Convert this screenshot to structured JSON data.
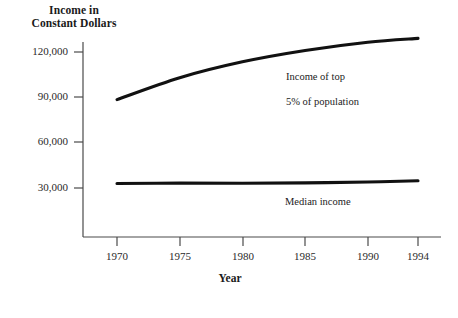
{
  "chart_data": {
    "type": "line",
    "title": "Income in Constant Dollars",
    "title_line1": "Income in",
    "title_line2": "Constant Dollars",
    "xlabel": "Year",
    "ylabel": "Income in Constant Dollars",
    "xlim": [
      1970,
      1994
    ],
    "ylim": [
      0,
      135000
    ],
    "grid": false,
    "legend_position": "inline-annotation",
    "x_ticks": [
      1970,
      1975,
      1980,
      1985,
      1990,
      1994
    ],
    "x_tick_labels": [
      "1970",
      "1975",
      "1980",
      "1985",
      "1990",
      "1994"
    ],
    "y_ticks": [
      30000,
      60000,
      90000,
      120000
    ],
    "y_tick_labels": [
      "30,000",
      "60,000",
      "90,000",
      "120,000"
    ],
    "x": [
      1970,
      1975,
      1980,
      1985,
      1990,
      1994
    ],
    "series": [
      {
        "name": "Income of top 5% of population",
        "annotation_line1": "Income of top",
        "annotation_line2": "5% of population",
        "color": "#111111",
        "values": [
          88500,
          103000,
          113500,
          121000,
          126500,
          129000
        ]
      },
      {
        "name": "Median income",
        "annotation_line1": "Median income",
        "annotation_line2": "",
        "color": "#111111",
        "values": [
          33000,
          33200,
          33100,
          33400,
          34000,
          34800
        ]
      }
    ]
  },
  "colors": {
    "background": "#ffffff",
    "axis": "#4a4a4a",
    "line": "#111111",
    "text": "#1a1a1a"
  }
}
